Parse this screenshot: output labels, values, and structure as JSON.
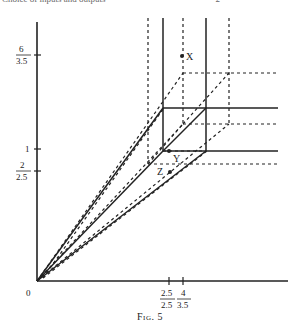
{
  "header": {
    "running_text": "Choice of inputs and outputs",
    "page_number": "2"
  },
  "figure": {
    "caption": "Fig. 5",
    "origin_label": "0",
    "y_axis": {
      "ticks": [
        {
          "num": "6",
          "den": "3.5"
        },
        {
          "num": "1",
          "den": ""
        },
        {
          "num": "2",
          "den": "2.5"
        }
      ]
    },
    "x_axis": {
      "ticks": [
        {
          "num": "2.5",
          "den": "2.5"
        },
        {
          "num": "4",
          "den": "3.5"
        }
      ]
    },
    "points": [
      {
        "label": "X"
      },
      {
        "label": "Y"
      },
      {
        "label": "Z"
      }
    ],
    "colors": {
      "ink": "#222222",
      "background": "#ffffff"
    }
  }
}
